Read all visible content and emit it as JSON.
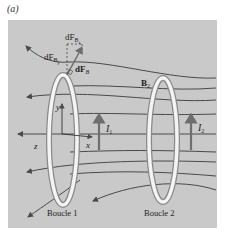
{
  "figure": {
    "panel_label": "(a)",
    "background_color": "#c9c9c9",
    "line_color": "#4a4a4a",
    "loop_color": "#f2f2f2"
  },
  "labels": {
    "dFBz": "dF",
    "dFBz_sub": "B",
    "dFBz_subsub": "z",
    "dFBy": "dF",
    "dFBy_sub": "B",
    "dFBy_subsub": "y",
    "dFB_vec": "dF",
    "dFB_vec_sub": "B",
    "B2": "B",
    "B2_sub": "2",
    "y_axis": "y",
    "z_axis": "z",
    "x_axis": "x",
    "I1": "I",
    "I1_sub": "1",
    "I2": "I",
    "I2_sub": "2",
    "loop1": "Boucle 1",
    "loop2": "Boucle 2"
  }
}
